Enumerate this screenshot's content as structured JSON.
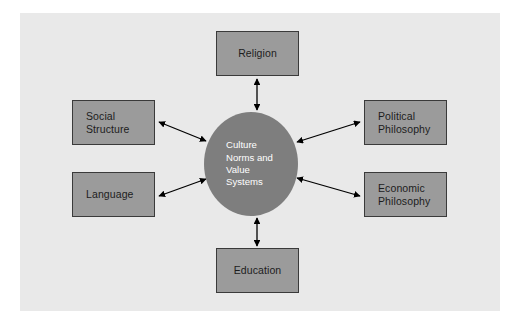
{
  "diagram": {
    "type": "hub-and-spoke",
    "frame": {
      "background_color": "#e9e9e9"
    },
    "colors": {
      "box_fill": "#9b9b9b",
      "box_border": "#3a3a3a",
      "circle_fill": "#7e7e7e",
      "circle_text": "#ffffff",
      "box_text": "#1d1d1d",
      "arrow": "#000000",
      "page_background": "#ffffff"
    },
    "center": {
      "id": "culture-norms-value-systems",
      "label": "Culture\nNorms and\nValue\nSystems",
      "shape": "circle"
    },
    "nodes": [
      {
        "id": "religion",
        "label": "Religion",
        "position": "top"
      },
      {
        "id": "social",
        "label": "Social\nStructure",
        "position": "upper-left"
      },
      {
        "id": "language",
        "label": "Language",
        "position": "lower-left"
      },
      {
        "id": "political",
        "label": "Political\nPhilosophy",
        "position": "upper-right"
      },
      {
        "id": "economic",
        "label": "Economic\nPhilosophy",
        "position": "lower-right"
      },
      {
        "id": "education",
        "label": "Education",
        "position": "bottom"
      }
    ],
    "connections": [
      {
        "from": "religion",
        "to": "culture-norms-value-systems",
        "style": "double-headed-arrow"
      },
      {
        "from": "social",
        "to": "culture-norms-value-systems",
        "style": "double-headed-arrow"
      },
      {
        "from": "language",
        "to": "culture-norms-value-systems",
        "style": "double-headed-arrow"
      },
      {
        "from": "political",
        "to": "culture-norms-value-systems",
        "style": "double-headed-arrow"
      },
      {
        "from": "economic",
        "to": "culture-norms-value-systems",
        "style": "double-headed-arrow"
      },
      {
        "from": "education",
        "to": "culture-norms-value-systems",
        "style": "double-headed-arrow"
      }
    ]
  }
}
